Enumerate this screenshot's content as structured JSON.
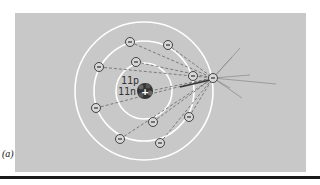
{
  "figure": {
    "caption": "(a)",
    "nucleus": {
      "protons_label": "11p",
      "neutrons_label": "11n",
      "charge_symbol": "+"
    },
    "electron_symbol": "−",
    "shells": 3,
    "electron_count": 11,
    "colors": {
      "background": "#c8c8c8",
      "orbit": "#ffffff",
      "electron_fill": "#d8d8d8",
      "trajectory": "#666666"
    }
  }
}
